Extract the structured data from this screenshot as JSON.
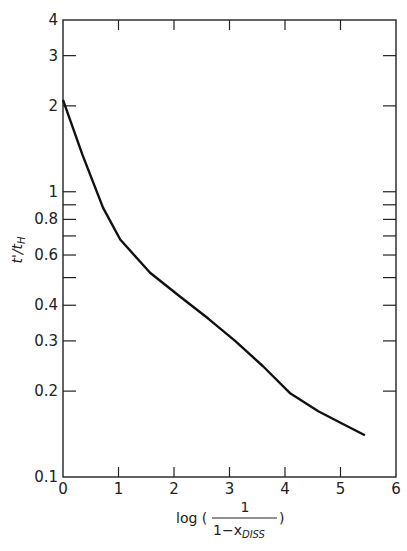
{
  "chart_data": {
    "type": "line",
    "title": "",
    "xlabel": "log (1 / (1 - x_DISS))",
    "ylabel": "t'/t_H",
    "xscale": "linear",
    "yscale": "log",
    "xlim": [
      0,
      6
    ],
    "ylim": [
      0.1,
      4
    ],
    "grid": false,
    "legend": null,
    "x_ticks": [
      0,
      1,
      2,
      3,
      4,
      5,
      6
    ],
    "x_tick_labels": [
      "0",
      "1",
      "2",
      "3",
      "4",
      "5",
      "6"
    ],
    "y_ticks": [
      0.1,
      0.2,
      0.3,
      0.4,
      0.5,
      0.6,
      0.7,
      0.8,
      0.9,
      1,
      2,
      3,
      4
    ],
    "y_tick_labels": [
      "0.1",
      "0.2",
      "0.3",
      "0.4",
      "",
      "0.6",
      "",
      "0.8",
      "",
      "1",
      "2",
      "3",
      "4"
    ],
    "series": [
      {
        "name": "t'/t_H",
        "x": [
          0.0,
          0.35,
          0.72,
          1.03,
          1.57,
          2.1,
          2.61,
          3.1,
          3.6,
          4.1,
          4.6,
          5.0,
          5.44
        ],
        "y": [
          2.1,
          1.35,
          0.88,
          0.68,
          0.52,
          0.43,
          0.36,
          0.3,
          0.245,
          0.196,
          0.17,
          0.155,
          0.14
        ]
      }
    ]
  },
  "axes": {
    "xlabel_prefix": "log (",
    "xlabel_numerator": "1",
    "xlabel_denominator": "1−x",
    "xlabel_subscript": "DISS",
    "xlabel_suffix": ")",
    "ylabel_text": "t'/t",
    "ylabel_subscript": "H"
  }
}
